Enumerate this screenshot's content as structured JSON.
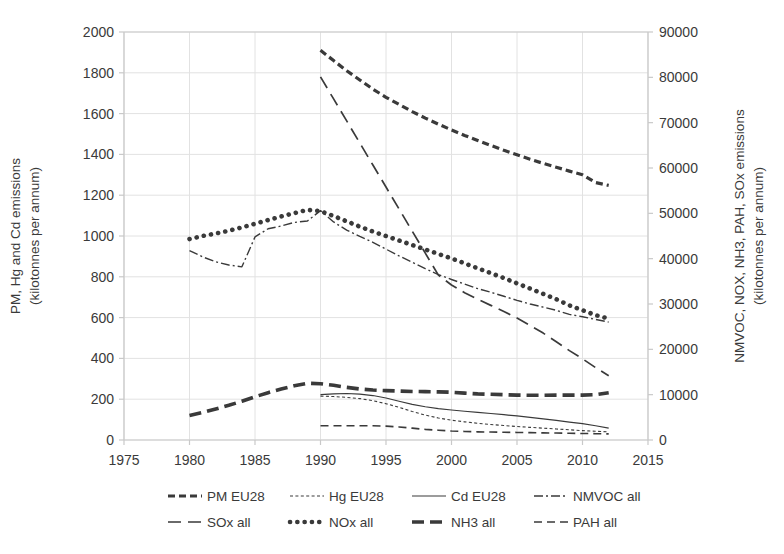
{
  "chart_data": {
    "type": "line",
    "title": "",
    "xlabel": "",
    "ylabel": "PM, Hg and Cd emissions (kilotonnes per annum)",
    "ylabel_secondary": "NMVOC, NOX, NH3, PAH, SOx emissions (kilotonnes per annum)",
    "xlim": [
      1975,
      2015
    ],
    "ylim": [
      0,
      2000
    ],
    "ylim_secondary": [
      0,
      90000
    ],
    "xticks": [
      1975,
      1980,
      1985,
      1990,
      1995,
      2000,
      2005,
      2010,
      2015
    ],
    "yticks": [
      0,
      200,
      400,
      600,
      800,
      1000,
      1200,
      1400,
      1600,
      1800,
      2000
    ],
    "yticks_secondary": [
      0,
      10000,
      20000,
      30000,
      40000,
      50000,
      60000,
      70000,
      80000,
      90000
    ],
    "grid": true,
    "legend_position": "bottom",
    "series": [
      {
        "name": "PM EU28",
        "axis": "left",
        "style": "dashed-thick",
        "x": [
          1990,
          1991,
          1992,
          1993,
          1994,
          1995,
          1996,
          1997,
          1998,
          1999,
          2000,
          2001,
          2002,
          2003,
          2004,
          2005,
          2006,
          2007,
          2008,
          2009,
          2010,
          2011,
          2012
        ],
        "values": [
          1910,
          1860,
          1810,
          1765,
          1720,
          1680,
          1645,
          1610,
          1578,
          1548,
          1520,
          1493,
          1468,
          1444,
          1420,
          1398,
          1376,
          1356,
          1337,
          1318,
          1300,
          1262,
          1248
        ]
      },
      {
        "name": "Hg EU28",
        "axis": "left",
        "style": "dotted-fine",
        "x": [
          1990,
          1991,
          1992,
          1993,
          1994,
          1995,
          1996,
          1997,
          1998,
          1999,
          2000,
          2001,
          2002,
          2003,
          2004,
          2005,
          2006,
          2007,
          2008,
          2009,
          2010,
          2011,
          2012
        ],
        "values": [
          215,
          213,
          209,
          203,
          193,
          178,
          160,
          140,
          122,
          108,
          97,
          89,
          82,
          76,
          71,
          66,
          62,
          58,
          54,
          50,
          46,
          43,
          40
        ]
      },
      {
        "name": "Cd EU28",
        "axis": "left",
        "style": "solid-thin",
        "x": [
          1990,
          1991,
          1992,
          1993,
          1994,
          1995,
          1996,
          1997,
          1998,
          1999,
          2000,
          2001,
          2002,
          2003,
          2004,
          2005,
          2006,
          2007,
          2008,
          2009,
          2010,
          2011,
          2012
        ],
        "values": [
          222,
          226,
          228,
          225,
          218,
          206,
          190,
          175,
          163,
          154,
          147,
          141,
          135,
          130,
          124,
          118,
          111,
          104,
          96,
          88,
          80,
          70,
          58
        ]
      },
      {
        "name": "NMVOC all",
        "axis": "right",
        "style": "dash-dot",
        "x": [
          1980,
          1981,
          1982,
          1983,
          1984,
          1985,
          1986,
          1987,
          1988,
          1989,
          1990,
          1991,
          1992,
          1993,
          1994,
          1995,
          1996,
          1997,
          1998,
          1999,
          2000,
          2001,
          2002,
          2003,
          2004,
          2005,
          2006,
          2007,
          2008,
          2009,
          2010,
          2011,
          2012
        ],
        "values": [
          41800,
          40400,
          39300,
          38600,
          38200,
          44800,
          46600,
          47200,
          48000,
          48300,
          50600,
          48100,
          46300,
          44900,
          43600,
          42100,
          40600,
          39200,
          37800,
          36500,
          35400,
          34400,
          33400,
          32600,
          31700,
          30800,
          30000,
          29300,
          28600,
          27700,
          27200,
          26600,
          26000
        ]
      },
      {
        "name": "SOx all",
        "axis": "left",
        "style": "long-dash",
        "x": [
          1990,
          1991,
          1992,
          1993,
          1994,
          1995,
          1996,
          1997,
          1998,
          1999,
          2000,
          2001,
          2002,
          2003,
          2004,
          2005,
          2006,
          2007,
          2008,
          2009,
          2010,
          2011,
          2012
        ],
        "values": [
          1780,
          1672,
          1564,
          1456,
          1348,
          1240,
          1132,
          1024,
          916,
          808,
          760,
          722,
          690,
          660,
          630,
          598,
          562,
          524,
          482,
          438,
          398,
          355,
          315
        ]
      },
      {
        "name": "NOx all",
        "axis": "left",
        "style": "dotted-thick",
        "x": [
          1980,
          1981,
          1982,
          1983,
          1984,
          1985,
          1986,
          1987,
          1988,
          1989,
          1990,
          1991,
          1992,
          1993,
          1994,
          1995,
          1996,
          1997,
          1998,
          1999,
          2000,
          2001,
          2002,
          2003,
          2004,
          2005,
          2006,
          2007,
          2008,
          2009,
          2010,
          2011,
          2012
        ],
        "values": [
          985,
          1000,
          1012,
          1026,
          1042,
          1060,
          1078,
          1096,
          1112,
          1128,
          1122,
          1098,
          1072,
          1046,
          1022,
          1000,
          978,
          956,
          934,
          912,
          890,
          866,
          842,
          818,
          794,
          768,
          742,
          716,
          690,
          660,
          636,
          612,
          595
        ]
      },
      {
        "name": "NH3 all",
        "axis": "left",
        "style": "dash-heavy",
        "x": [
          1980,
          1981,
          1982,
          1983,
          1984,
          1985,
          1986,
          1987,
          1988,
          1989,
          1990,
          1991,
          1992,
          1993,
          1994,
          1995,
          1996,
          1997,
          1998,
          1999,
          2000,
          2001,
          2002,
          2003,
          2004,
          2005,
          2006,
          2007,
          2008,
          2009,
          2010,
          2011,
          2012
        ],
        "values": [
          120,
          135,
          152,
          170,
          190,
          212,
          232,
          250,
          266,
          278,
          276,
          268,
          258,
          250,
          245,
          242,
          240,
          238,
          237,
          236,
          234,
          230,
          226,
          224,
          222,
          220,
          219,
          219,
          220,
          220,
          220,
          222,
          232
        ]
      },
      {
        "name": "PAH all",
        "axis": "left",
        "style": "dashed-medium",
        "x": [
          1990,
          1991,
          1992,
          1993,
          1994,
          1995,
          1996,
          1997,
          1998,
          1999,
          2000,
          2001,
          2002,
          2003,
          2004,
          2005,
          2006,
          2007,
          2008,
          2009,
          2010,
          2011,
          2012
        ],
        "values": [
          70,
          70,
          70,
          70,
          70,
          68,
          64,
          58,
          52,
          48,
          44,
          42,
          40,
          39,
          38,
          37,
          36,
          35,
          34,
          33,
          32,
          31,
          30
        ]
      }
    ]
  },
  "axes": {
    "left_title": "PM, Hg and Cd emissions\n(kilotonnes per annum)",
    "left_title_line1": "PM, Hg and Cd emissions",
    "left_title_line2": "(kilotonnes per annum)",
    "right_title_line1": "NMVOC, NOX, NH3, PAH, SOx emissions",
    "right_title_line2": "(kilotonnes per annum)"
  },
  "legend": {
    "items": [
      {
        "label": "PM EU28",
        "style": "dashed-thick"
      },
      {
        "label": "Hg EU28",
        "style": "dotted-fine"
      },
      {
        "label": "Cd EU28",
        "style": "solid-thin"
      },
      {
        "label": "NMVOC all",
        "style": "dash-dot"
      },
      {
        "label": "SOx all",
        "style": "long-dash"
      },
      {
        "label": "NOx all",
        "style": "dotted-thick"
      },
      {
        "label": "NH3 all",
        "style": "dash-heavy"
      },
      {
        "label": "PAH all",
        "style": "dashed-medium"
      }
    ]
  },
  "colors": {
    "series": "#3a3a3a",
    "grid": "#e2e2e2",
    "axis": "#c9c9c9",
    "text": "#3a3a3a",
    "background": "#ffffff"
  }
}
